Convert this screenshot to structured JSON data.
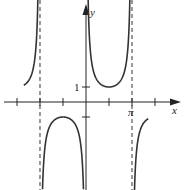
{
  "chart_data": {
    "type": "line",
    "title": "",
    "function": "y = csc x",
    "xlabel": "x",
    "ylabel": "y",
    "x_tick_labels": [
      {
        "value": 3.14159,
        "label": "π"
      }
    ],
    "y_tick_labels": [
      {
        "value": 1,
        "label": "1"
      }
    ],
    "x_ticks": [
      -4.712,
      -3.1416,
      -1.5708,
      1.5708,
      3.1416,
      4.712
    ],
    "asymptotes_x": [
      -3.1416,
      0,
      3.1416
    ],
    "xlim": [
      -5.5,
      6.2
    ],
    "ylim": [
      -6,
      6
    ],
    "grid": false,
    "series": [
      {
        "name": "csc x",
        "x": [
          -4.2,
          -3.9,
          -3.6,
          -3.3
        ],
        "y": [
          1.15,
          1.45,
          2.3,
          6.4
        ]
      },
      {
        "name": "csc x",
        "x": [
          -3.0,
          -2.5,
          -2.0,
          -1.5708,
          -1.0,
          -0.5,
          -0.2
        ],
        "y": [
          -7.1,
          -1.67,
          -1.1,
          -1,
          -1.19,
          -2.09,
          -5.03
        ]
      },
      {
        "name": "csc x",
        "x": [
          0.2,
          0.5,
          1.0,
          1.5708,
          2.0,
          2.5,
          3.0
        ],
        "y": [
          5.03,
          2.09,
          1.19,
          1,
          1.1,
          1.67,
          7.1
        ]
      },
      {
        "name": "csc x",
        "x": [
          3.3,
          3.6,
          3.9,
          4.2
        ],
        "y": [
          -6.4,
          -2.3,
          -1.45,
          -1.15
        ]
      }
    ],
    "labels": {
      "x": "x",
      "y": "y",
      "pi": "π",
      "one": "1"
    }
  }
}
